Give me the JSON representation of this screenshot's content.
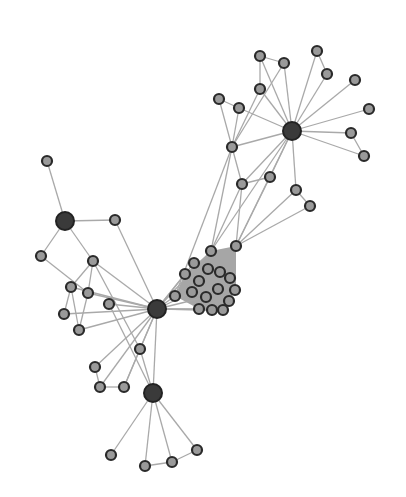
{
  "graph": {
    "type": "force-directed network",
    "width": 406,
    "height": 497,
    "colors": {
      "background": "#ffffff",
      "edge": "#a9a9a9",
      "node_fill": "#9a9a9a",
      "node_stroke": "#2a2a2a",
      "hub_fill": "#3a3a3a"
    },
    "hubs": [
      {
        "id": "H1",
        "x": 292,
        "y": 131,
        "r": 9
      },
      {
        "id": "H2",
        "x": 65,
        "y": 221,
        "r": 9
      },
      {
        "id": "H3",
        "x": 157,
        "y": 309,
        "r": 9
      },
      {
        "id": "H4",
        "x": 153,
        "y": 393,
        "r": 9
      }
    ],
    "nodes": [
      {
        "id": "a1",
        "x": 260,
        "y": 56
      },
      {
        "id": "a2",
        "x": 284,
        "y": 63
      },
      {
        "id": "a3",
        "x": 317,
        "y": 51
      },
      {
        "id": "a4",
        "x": 327,
        "y": 74
      },
      {
        "id": "a5",
        "x": 355,
        "y": 80
      },
      {
        "id": "a6",
        "x": 369,
        "y": 109
      },
      {
        "id": "a7",
        "x": 351,
        "y": 133
      },
      {
        "id": "a8",
        "x": 364,
        "y": 156
      },
      {
        "id": "a9",
        "x": 260,
        "y": 89
      },
      {
        "id": "a10",
        "x": 219,
        "y": 99
      },
      {
        "id": "a11",
        "x": 239,
        "y": 108
      },
      {
        "id": "a12",
        "x": 232,
        "y": 147
      },
      {
        "id": "a13",
        "x": 242,
        "y": 184
      },
      {
        "id": "a14",
        "x": 270,
        "y": 177
      },
      {
        "id": "a15",
        "x": 296,
        "y": 190
      },
      {
        "id": "a16",
        "x": 310,
        "y": 206
      },
      {
        "id": "c1",
        "x": 211,
        "y": 251
      },
      {
        "id": "c2",
        "x": 236,
        "y": 246
      },
      {
        "id": "c3",
        "x": 194,
        "y": 263
      },
      {
        "id": "c4",
        "x": 208,
        "y": 269
      },
      {
        "id": "c5",
        "x": 220,
        "y": 272
      },
      {
        "id": "c6",
        "x": 185,
        "y": 274
      },
      {
        "id": "c7",
        "x": 199,
        "y": 281
      },
      {
        "id": "c8",
        "x": 230,
        "y": 278
      },
      {
        "id": "c9",
        "x": 192,
        "y": 292
      },
      {
        "id": "c10",
        "x": 218,
        "y": 289
      },
      {
        "id": "c11",
        "x": 235,
        "y": 290
      },
      {
        "id": "c12",
        "x": 175,
        "y": 296
      },
      {
        "id": "c13",
        "x": 206,
        "y": 297
      },
      {
        "id": "c14",
        "x": 229,
        "y": 301
      },
      {
        "id": "c15",
        "x": 199,
        "y": 309
      },
      {
        "id": "c16",
        "x": 212,
        "y": 310
      },
      {
        "id": "c17",
        "x": 223,
        "y": 310
      },
      {
        "id": "b1",
        "x": 47,
        "y": 161
      },
      {
        "id": "b2",
        "x": 115,
        "y": 220
      },
      {
        "id": "b3",
        "x": 41,
        "y": 256
      },
      {
        "id": "b4",
        "x": 93,
        "y": 261
      },
      {
        "id": "b5",
        "x": 71,
        "y": 287
      },
      {
        "id": "b6",
        "x": 88,
        "y": 293
      },
      {
        "id": "b7",
        "x": 109,
        "y": 304
      },
      {
        "id": "b8",
        "x": 64,
        "y": 314
      },
      {
        "id": "b9",
        "x": 79,
        "y": 330
      },
      {
        "id": "d1",
        "x": 140,
        "y": 349
      },
      {
        "id": "d2",
        "x": 95,
        "y": 367
      },
      {
        "id": "d3",
        "x": 100,
        "y": 387
      },
      {
        "id": "d4",
        "x": 124,
        "y": 387
      },
      {
        "id": "d5",
        "x": 111,
        "y": 455
      },
      {
        "id": "d6",
        "x": 145,
        "y": 466
      },
      {
        "id": "d7",
        "x": 172,
        "y": 462
      },
      {
        "id": "d8",
        "x": 197,
        "y": 450
      }
    ],
    "edges": [
      [
        "H1",
        "a1"
      ],
      [
        "H1",
        "a2"
      ],
      [
        "H1",
        "a3"
      ],
      [
        "H1",
        "a4"
      ],
      [
        "H1",
        "a5"
      ],
      [
        "H1",
        "a6"
      ],
      [
        "H1",
        "a7"
      ],
      [
        "H1",
        "a8"
      ],
      [
        "H1",
        "a9"
      ],
      [
        "H1",
        "a11"
      ],
      [
        "H1",
        "a12"
      ],
      [
        "H1",
        "a13"
      ],
      [
        "H1",
        "a14"
      ],
      [
        "H1",
        "a15"
      ],
      [
        "H1",
        "c2"
      ],
      [
        "H1",
        "c1"
      ],
      [
        "a1",
        "a2"
      ],
      [
        "a1",
        "a9"
      ],
      [
        "a3",
        "a4"
      ],
      [
        "a7",
        "a8"
      ],
      [
        "a9",
        "a12"
      ],
      [
        "a2",
        "a12"
      ],
      [
        "a10",
        "a11"
      ],
      [
        "a10",
        "a12"
      ],
      [
        "a11",
        "a12"
      ],
      [
        "a12",
        "a13"
      ],
      [
        "a13",
        "a14"
      ],
      [
        "a15",
        "a16"
      ],
      [
        "a12",
        "c1"
      ],
      [
        "a13",
        "c2"
      ],
      [
        "a14",
        "c2"
      ],
      [
        "a16",
        "c2"
      ],
      [
        "a13",
        "c1"
      ],
      [
        "a12",
        "c12"
      ],
      [
        "a15",
        "c2"
      ],
      [
        "H2",
        "b1"
      ],
      [
        "H2",
        "b2"
      ],
      [
        "H2",
        "b3"
      ],
      [
        "H2",
        "b4"
      ],
      [
        "b2",
        "H3"
      ],
      [
        "b3",
        "b6"
      ],
      [
        "b4",
        "b5"
      ],
      [
        "b4",
        "b6"
      ],
      [
        "b4",
        "H3"
      ],
      [
        "b5",
        "b8"
      ],
      [
        "b5",
        "b9"
      ],
      [
        "b6",
        "b9"
      ],
      [
        "b6",
        "H3"
      ],
      [
        "b7",
        "H3"
      ],
      [
        "b8",
        "H3"
      ],
      [
        "b9",
        "H3"
      ],
      [
        "b5",
        "H3"
      ],
      [
        "b4",
        "d1"
      ],
      [
        "b7",
        "H4"
      ],
      [
        "H3",
        "c12"
      ],
      [
        "H3",
        "c6"
      ],
      [
        "H3",
        "c9"
      ],
      [
        "H3",
        "c3"
      ],
      [
        "H3",
        "c15"
      ],
      [
        "H3",
        "c16"
      ],
      [
        "H3",
        "c13"
      ],
      [
        "H3",
        "c1"
      ],
      [
        "H3",
        "c17"
      ],
      [
        "H3",
        "d1"
      ],
      [
        "H3",
        "d2"
      ],
      [
        "H3",
        "d3"
      ],
      [
        "H3",
        "d4"
      ],
      [
        "H3",
        "H4"
      ],
      [
        "d2",
        "d3"
      ],
      [
        "d3",
        "d4"
      ],
      [
        "d1",
        "H4"
      ],
      [
        "d1",
        "d4"
      ],
      [
        "H4",
        "d5"
      ],
      [
        "H4",
        "d6"
      ],
      [
        "H4",
        "d7"
      ],
      [
        "H4",
        "d8"
      ],
      [
        "d6",
        "d7"
      ],
      [
        "d7",
        "d8"
      ]
    ],
    "dense_cluster_hull": "211,251 236,246 236,290 223,310 199,309 175,296 185,274"
  }
}
